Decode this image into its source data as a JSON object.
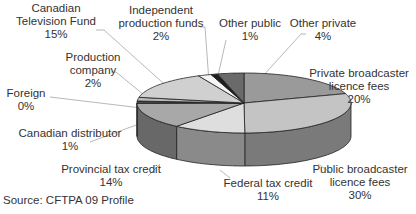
{
  "chart_data": {
    "type": "pie",
    "style": "3d",
    "title": "",
    "source": "Source: CFTPA 09 Profile",
    "slices": [
      {
        "label": "Private broadcaster licence fees",
        "value": 20,
        "display": "20%",
        "color": "#9a9a9a"
      },
      {
        "label": "Public broadcaster licence fees",
        "value": 30,
        "display": "30%",
        "color": "#c4c4c4"
      },
      {
        "label": "Federal tax credit",
        "value": 11,
        "display": "11%",
        "color": "#dedede"
      },
      {
        "label": "Provincial tax credit",
        "value": 14,
        "display": "14%",
        "color": "#a8a8a8"
      },
      {
        "label": "Canadian distributor",
        "value": 1,
        "display": "1%",
        "color": "#555555"
      },
      {
        "label": "Foreign",
        "value": 0,
        "display": "0%",
        "color": "#888888"
      },
      {
        "label": "Production company",
        "value": 2,
        "display": "2%",
        "color": "#bcbcbc"
      },
      {
        "label": "Canadian Television Fund",
        "value": 15,
        "display": "15%",
        "color": "#d0d0d0"
      },
      {
        "label": "Independent production funds",
        "value": 2,
        "display": "2%",
        "color": "#f4f4f4"
      },
      {
        "label": "Other public",
        "value": 1,
        "display": "1%",
        "color": "#1e1e1e"
      },
      {
        "label": "Other private",
        "value": 4,
        "display": "4%",
        "color": "#6a6a6a"
      }
    ]
  },
  "labels": {
    "ctf": {
      "line1": "Canadian",
      "line2": "Television Fund",
      "pct": "15%"
    },
    "ipf": {
      "line1": "Independent",
      "line2": "production funds",
      "pct": "2%"
    },
    "other_public": {
      "line1": "Other public",
      "pct": "1%"
    },
    "other_private": {
      "line1": "Other private",
      "pct": "4%"
    },
    "prod_company": {
      "line1": "Production",
      "line2": "company",
      "pct": "2%"
    },
    "foreign": {
      "line1": "Foreign",
      "pct": "0%"
    },
    "private_bc": {
      "line1": "Private broadcaster",
      "line2": "licence fees",
      "pct": "20%"
    },
    "can_dist": {
      "line1": "Canadian distributor",
      "pct": "1%"
    },
    "prov_tax": {
      "line1": "Provincial tax credit",
      "pct": "14%"
    },
    "fed_tax": {
      "line1": "Federal tax credit",
      "pct": "11%"
    },
    "public_bc": {
      "line1": "Public broadcaster",
      "line2": "licence fees",
      "pct": "30%"
    }
  },
  "source": "Source: CFTPA 09 Profile"
}
